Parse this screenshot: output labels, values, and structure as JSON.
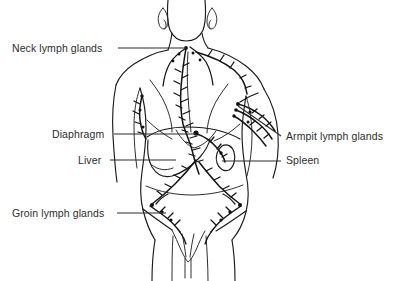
{
  "figure": {
    "line_color": "#1a1a1a",
    "background_color": "#ffffff",
    "text_color": "#2d2d2d"
  },
  "labels": [
    {
      "id": "neck-lymph-glands",
      "text": "Neck lymph glands",
      "side": "left",
      "x": 12,
      "y": 44,
      "leader": {
        "type": "horizontal",
        "x1": 118,
        "y1": 48,
        "x2": 186,
        "y2": 48
      },
      "target": "cervical lymph nodes"
    },
    {
      "id": "diaphragm",
      "text": "Diaphragm",
      "side": "left",
      "x": 52,
      "y": 130,
      "leader": {
        "type": "horizontal",
        "x1": 114,
        "y1": 134,
        "x2": 196,
        "y2": 134
      },
      "target": "diaphragm"
    },
    {
      "id": "liver",
      "text": "Liver",
      "side": "left",
      "x": 78,
      "y": 156,
      "leader": {
        "type": "horizontal",
        "x1": 110,
        "y1": 160,
        "x2": 176,
        "y2": 160
      },
      "target": "liver"
    },
    {
      "id": "groin-lymph-glands",
      "text": "Groin lymph glands",
      "side": "left",
      "x": 12,
      "y": 209,
      "leader": {
        "type": "horizontal",
        "x1": 117,
        "y1": 213,
        "x2": 166,
        "y2": 213
      },
      "target": "inguinal lymph nodes"
    },
    {
      "id": "armpit-lymph-glands",
      "text": "Armpit lymph glands",
      "side": "right",
      "x": 285,
      "y": 133,
      "leader": {
        "type": "diagonal",
        "x1": 281,
        "y1": 136,
        "x2": 238,
        "y2": 106
      },
      "target": "axillary lymph nodes"
    },
    {
      "id": "spleen",
      "text": "Spleen",
      "side": "right",
      "x": 285,
      "y": 157,
      "leader": {
        "type": "horizontal",
        "x1": 281,
        "y1": 161,
        "x2": 222,
        "y2": 161
      },
      "target": "spleen"
    }
  ],
  "anatomy_parts": [
    {
      "id": "head-jaw",
      "name": "jaw and chin outline"
    },
    {
      "id": "ear-left",
      "name": "left ear"
    },
    {
      "id": "ear-right",
      "name": "right ear"
    },
    {
      "id": "neck",
      "name": "neck"
    },
    {
      "id": "shoulders",
      "name": "shoulders"
    },
    {
      "id": "arm-left",
      "name": "left arm"
    },
    {
      "id": "arm-right",
      "name": "right arm"
    },
    {
      "id": "torso",
      "name": "torso outline"
    },
    {
      "id": "rib-cage",
      "name": "rib cage / chest"
    },
    {
      "id": "diaphragm-arc",
      "name": "diaphragm arc"
    },
    {
      "id": "liver-shape",
      "name": "liver"
    },
    {
      "id": "spleen-shape",
      "name": "spleen"
    },
    {
      "id": "pelvis",
      "name": "pelvis and groin"
    },
    {
      "id": "legs",
      "name": "upper legs"
    },
    {
      "id": "thoracic-duct",
      "name": "thoracic duct"
    },
    {
      "id": "lymph-chains",
      "name": "lymph vessel chains"
    }
  ]
}
